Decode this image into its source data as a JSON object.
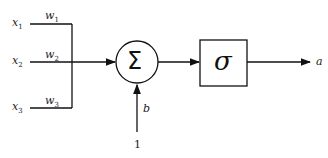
{
  "inputs": [
    {
      "name": "x",
      "sub": "1",
      "weight": "w",
      "wsub": "1"
    },
    {
      "name": "x",
      "sub": "2",
      "weight": "w",
      "wsub": "2"
    },
    {
      "name": "x",
      "sub": "3",
      "weight": "w",
      "wsub": "3"
    }
  ],
  "summation_symbol": "Σ",
  "activation_symbol": "σ",
  "bias_label": "b",
  "bias_input": "1",
  "output_label": "a"
}
